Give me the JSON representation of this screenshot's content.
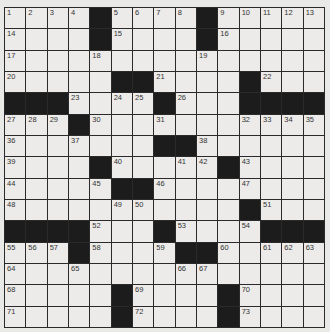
{
  "puzzle": {
    "rows": 15,
    "cols": 15,
    "colors": {
      "background": "#e9e9e7",
      "cell": "#ecebe9",
      "block": "#1c1c1c",
      "line": "#2a2a2a"
    },
    "grid": [
      [
        "1",
        "2",
        "3",
        "4",
        "#",
        "5",
        "6",
        "7",
        "8",
        "#",
        "9",
        "10",
        "11",
        "12",
        "13"
      ],
      [
        "14",
        "",
        "",
        "",
        "#",
        "15",
        "",
        "",
        "",
        "#",
        "16",
        "",
        "",
        "",
        ""
      ],
      [
        "17",
        "",
        "",
        "",
        "18",
        "",
        "",
        "",
        "",
        "19",
        "",
        "",
        "",
        "",
        ""
      ],
      [
        "20",
        "",
        "",
        "",
        "",
        "#",
        "#",
        "21",
        "",
        "",
        "",
        "#",
        "22",
        "",
        ""
      ],
      [
        "#",
        "#",
        "#",
        "23",
        "",
        "24",
        "25",
        "#",
        "26",
        "",
        "",
        "#",
        "#",
        "#",
        "#"
      ],
      [
        "27",
        "28",
        "29",
        "#",
        "30",
        "",
        "",
        "31",
        "",
        "",
        "",
        "32",
        "33",
        "34",
        "35"
      ],
      [
        "36",
        "",
        "",
        "37",
        "",
        "",
        "",
        "#",
        "#",
        "38",
        "",
        "",
        "",
        "",
        ""
      ],
      [
        "39",
        "",
        "",
        "",
        "#",
        "40",
        "",
        "",
        "41",
        "42",
        "#",
        "43",
        "",
        "",
        ""
      ],
      [
        "44",
        "",
        "",
        "",
        "45",
        "#",
        "#",
        "46",
        "",
        "",
        "",
        "47",
        "",
        "",
        ""
      ],
      [
        "48",
        "",
        "",
        "",
        "",
        "49",
        "50",
        "",
        "",
        "",
        "",
        "#",
        "51",
        "",
        ""
      ],
      [
        "#",
        "#",
        "#",
        "#",
        "52",
        "",
        "",
        "#",
        "53",
        "",
        "",
        "54",
        "#",
        "#",
        "#"
      ],
      [
        "55",
        "56",
        "57",
        "#",
        "58",
        "",
        "",
        "59",
        "#",
        "#",
        "60",
        "",
        "61",
        "62",
        "63"
      ],
      [
        "64",
        "",
        "",
        "65",
        "",
        "",
        "",
        "",
        "66",
        "67",
        "",
        "",
        "",
        "",
        ""
      ],
      [
        "68",
        "",
        "",
        "",
        "",
        "#",
        "69",
        "",
        "",
        "",
        "#",
        "70",
        "",
        "",
        ""
      ],
      [
        "71",
        "",
        "",
        "",
        "",
        "#",
        "72",
        "",
        "",
        "",
        "#",
        "73",
        "",
        "",
        ""
      ]
    ]
  }
}
